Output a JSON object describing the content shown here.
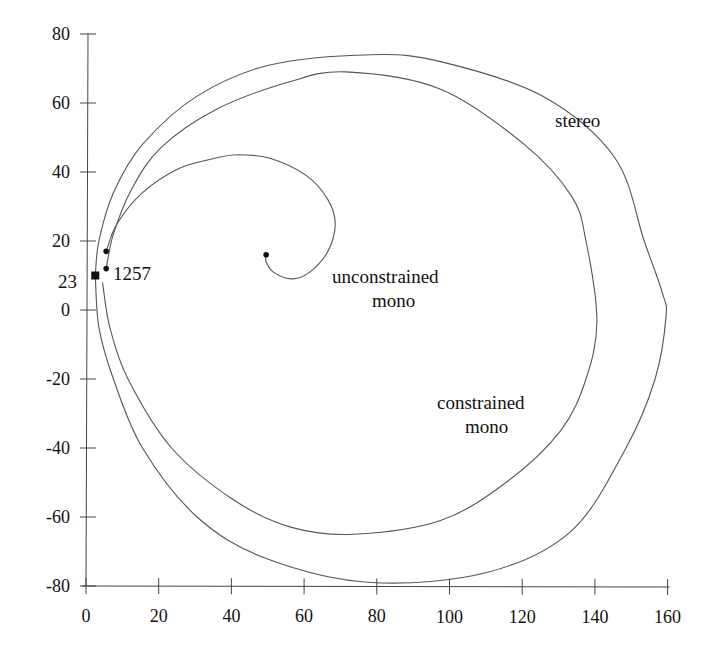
{
  "chart_data": {
    "type": "line",
    "title": "",
    "xlabel": "",
    "ylabel": "",
    "xlim": [
      0,
      160
    ],
    "ylim": [
      -80,
      80
    ],
    "grid": false,
    "legend": "none (curves labeled inline)",
    "x_ticks": [
      "0",
      "20",
      "40",
      "60",
      "80",
      "100",
      "120",
      "140",
      "160"
    ],
    "y_ticks": [
      "80",
      "60",
      "40",
      "20",
      "0",
      "-20",
      "-40",
      "-60",
      "-80"
    ],
    "series": [
      {
        "name": "stereo",
        "x": [
          2,
          3,
          7,
          15,
          30,
          50,
          78,
          97,
          125,
          145,
          153,
          158,
          159,
          156,
          148,
          133,
          110,
          78,
          49,
          30,
          15,
          7,
          3,
          2
        ],
        "y": [
          10,
          20,
          34,
          48,
          62,
          71,
          74,
          72,
          62,
          44,
          20,
          5,
          -2,
          -20,
          -40,
          -64,
          -76,
          -79,
          -72,
          -60,
          -40,
          -20,
          -5,
          10
        ]
      },
      {
        "name": "constrained mono",
        "x": [
          5,
          7,
          12,
          20,
          35,
          55,
          71,
          97,
          120,
          133,
          137,
          140,
          137,
          130,
          115,
          97,
          73,
          56,
          40,
          23,
          11,
          6,
          4
        ],
        "y": [
          12,
          22,
          35,
          47,
          58,
          66,
          69,
          64,
          48,
          33,
          20,
          -3,
          -20,
          -35,
          -50,
          -61,
          -65,
          -63,
          -55,
          -40,
          -20,
          -5,
          8
        ]
      },
      {
        "name": "unconstrained mono",
        "x": [
          5,
          8,
          15,
          25,
          35,
          41,
          50,
          60,
          66,
          68,
          66,
          61,
          56,
          51,
          49,
          49
        ],
        "y": [
          17,
          25,
          34,
          41,
          44,
          45,
          44,
          39,
          32,
          25,
          17,
          11,
          9,
          11,
          14,
          16
        ]
      }
    ],
    "points": [
      {
        "label": "23",
        "x": 2,
        "y": 10,
        "marker": "square"
      },
      {
        "label": "1257",
        "x": 5,
        "y": 12,
        "marker": "dot"
      },
      {
        "label": "",
        "x": 5,
        "y": 17,
        "marker": "dot"
      },
      {
        "label": "",
        "x": 49,
        "y": 16,
        "marker": "dot"
      }
    ],
    "annotations": [
      {
        "text": "stereo",
        "x": 133,
        "y": 55
      },
      {
        "text": "unconstrained",
        "x": 87,
        "y": 10
      },
      {
        "text": "mono",
        "x": 87,
        "y": 3
      },
      {
        "text": "constrained",
        "x": 115,
        "y": -29
      },
      {
        "text": "mono",
        "x": 115,
        "y": -36
      },
      {
        "text": "23",
        "x": -9,
        "y": 9
      },
      {
        "text": "1257",
        "x": 7,
        "y": 11
      }
    ]
  },
  "labels": {
    "stereo": "stereo",
    "unconstrained_line1": "unconstrained",
    "unconstrained_line2": "mono",
    "constrained_line1": "constrained",
    "constrained_line2": "mono",
    "point_23": "23",
    "point_1257": "1257"
  },
  "colors": {
    "curve": "#555555",
    "axis": "#444444",
    "text": "#111111",
    "background": "#ffffff"
  }
}
